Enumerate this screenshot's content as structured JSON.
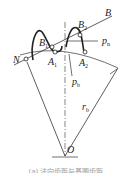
{
  "diagram": {
    "labels": {
      "B": "B",
      "B1": "B",
      "B1_sub": "1",
      "B2": "B",
      "B2_sub": "2",
      "A1": "A",
      "A1_sub": "1",
      "A2": "A",
      "A2_sub": "2",
      "N": "N",
      "pn": "p",
      "pn_sub": "n",
      "pb": "p",
      "pb_sub": "b",
      "rb": "r",
      "rb_sub": "b",
      "O": "O"
    },
    "caption": "(a) 法向齿距与基圆齿距"
  }
}
